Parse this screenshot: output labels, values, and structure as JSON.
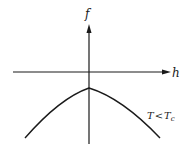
{
  "diagram": {
    "y_axis_label": "f",
    "x_axis_label": "h",
    "curve_label_T": "T",
    "curve_label_op": "<",
    "curve_label_Tc": "T",
    "curve_label_sub": "c",
    "line_color": "#1a1a1a"
  }
}
